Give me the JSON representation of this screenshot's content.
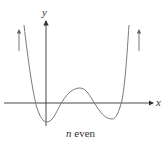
{
  "figure": {
    "caption_var": "n",
    "caption_text": " even",
    "x_axis_label": "x",
    "y_axis_label": "y",
    "curve_color": "#7a7a7a",
    "axis_color": "#333333"
  }
}
